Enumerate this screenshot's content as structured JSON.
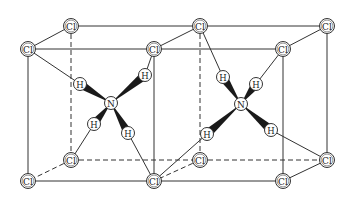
{
  "colors": {
    "line": "#333333",
    "atom_fill": "#ffffff",
    "atom_stroke": "#333333",
    "bond_wedge": "#1a1a1a",
    "background": "#ffffff"
  },
  "atoms": {
    "cl": [
      {
        "id": "cl_tb1",
        "label": "Cl",
        "x": 71,
        "y": 26
      },
      {
        "id": "cl_tb2",
        "label": "Cl",
        "x": 200,
        "y": 26
      },
      {
        "id": "cl_tb3",
        "label": "Cl",
        "x": 327,
        "y": 26
      },
      {
        "id": "cl_tf1",
        "label": "Cl",
        "x": 28,
        "y": 49
      },
      {
        "id": "cl_tf2",
        "label": "Cl",
        "x": 154,
        "y": 49
      },
      {
        "id": "cl_tf3",
        "label": "Cl",
        "x": 283,
        "y": 49
      },
      {
        "id": "cl_bb1",
        "label": "Cl",
        "x": 71,
        "y": 160
      },
      {
        "id": "cl_bb2",
        "label": "Cl",
        "x": 200,
        "y": 160
      },
      {
        "id": "cl_bb3",
        "label": "Cl",
        "x": 327,
        "y": 160
      },
      {
        "id": "cl_bf1",
        "label": "Cl",
        "x": 28,
        "y": 181
      },
      {
        "id": "cl_bf2",
        "label": "Cl",
        "x": 154,
        "y": 181
      },
      {
        "id": "cl_bf3",
        "label": "Cl",
        "x": 283,
        "y": 181
      }
    ],
    "n": [
      {
        "id": "n1",
        "label": "N",
        "x": 111,
        "y": 103
      },
      {
        "id": "n2",
        "label": "N",
        "x": 241,
        "y": 104
      }
    ],
    "h": [
      {
        "id": "h1a",
        "label": "H",
        "x": 80,
        "y": 84,
        "n": "n1",
        "to": "cl_tf1"
      },
      {
        "id": "h1b",
        "label": "H",
        "x": 145,
        "y": 75,
        "n": "n1",
        "to": "cl_tf2"
      },
      {
        "id": "h1c",
        "label": "H",
        "x": 94,
        "y": 124,
        "n": "n1",
        "to": "cl_bb1"
      },
      {
        "id": "h1d",
        "label": "H",
        "x": 128,
        "y": 133,
        "n": "n1",
        "to": "cl_bf2"
      },
      {
        "id": "h2a",
        "label": "H",
        "x": 223,
        "y": 77,
        "n": "n2",
        "to": "cl_tb2"
      },
      {
        "id": "h2b",
        "label": "H",
        "x": 256,
        "y": 84,
        "n": "n2",
        "to": "cl_tf3"
      },
      {
        "id": "h2c",
        "label": "H",
        "x": 207,
        "y": 134,
        "n": "n2",
        "to": "cl_bf2"
      },
      {
        "id": "h2d",
        "label": "H",
        "x": 271,
        "y": 130,
        "n": "n2",
        "to": "cl_bb3"
      }
    ]
  },
  "edges": {
    "solid": [
      [
        "cl_tb1",
        "cl_tb2"
      ],
      [
        "cl_tb2",
        "cl_tb3"
      ],
      [
        "cl_tf1",
        "cl_tf2"
      ],
      [
        "cl_tf2",
        "cl_tf3"
      ],
      [
        "cl_tb1",
        "cl_tf1"
      ],
      [
        "cl_tb2",
        "cl_tf2"
      ],
      [
        "cl_tb3",
        "cl_tf3"
      ],
      [
        "cl_bf1",
        "cl_bf2"
      ],
      [
        "cl_bf2",
        "cl_bf3"
      ],
      [
        "cl_tf1",
        "cl_bf1"
      ],
      [
        "cl_tf2",
        "cl_bf2"
      ],
      [
        "cl_tf3",
        "cl_bf3"
      ],
      [
        "cl_tb3",
        "cl_bb3"
      ],
      [
        "cl_bb3",
        "cl_bf3"
      ]
    ],
    "dashed": [
      [
        "cl_tb1",
        "cl_bb1"
      ],
      [
        "cl_tb2",
        "cl_bb2"
      ],
      [
        "cl_bb1",
        "cl_bb2"
      ],
      [
        "cl_bb2",
        "cl_bb3"
      ],
      [
        "cl_bb1",
        "cl_bf1"
      ],
      [
        "cl_bb2",
        "cl_bf2"
      ]
    ]
  }
}
